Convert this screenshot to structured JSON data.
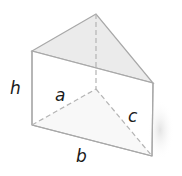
{
  "figure": {
    "type": "triangular-prism",
    "labels": {
      "height": "h",
      "side_a": "a",
      "side_b": "b",
      "side_c": "c"
    },
    "colors": {
      "edge": "#a8a8a8",
      "hidden_edge": "#b4b4b4",
      "top_face": "#ebebeb",
      "bottom_face": "#efefef",
      "front_face": "#ffffff",
      "text": "#1a1a1a"
    }
  }
}
